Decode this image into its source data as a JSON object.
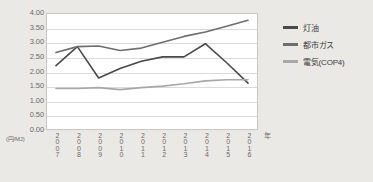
{
  "chart_data": {
    "type": "line",
    "title": "",
    "xlabel": "年",
    "ylabel": "(円/MJ)",
    "ylim": [
      0.0,
      4.0
    ],
    "y_ticks": [
      "4.00",
      "3.50",
      "3.00",
      "2.50",
      "2.00",
      "1.50",
      "1.00",
      "0.50",
      "0.00"
    ],
    "y_tick_values": [
      4.0,
      3.5,
      3.0,
      2.5,
      2.0,
      1.5,
      1.0,
      0.5,
      0.0
    ],
    "grid": true,
    "legend_position": "right",
    "categories": [
      "2007",
      "2008",
      "2009",
      "2010",
      "2011",
      "2012",
      "2013",
      "2014",
      "2015",
      "2016"
    ],
    "series": [
      {
        "name": "灯油",
        "color": "#4a4a4a",
        "values": [
          2.2,
          2.85,
          1.78,
          2.1,
          2.35,
          2.5,
          2.5,
          2.95,
          2.3,
          1.6
        ]
      },
      {
        "name": "都市ガス",
        "color": "#6e6e6e",
        "values": [
          2.65,
          2.85,
          2.87,
          2.72,
          2.8,
          3.0,
          3.2,
          3.35,
          3.55,
          3.75
        ]
      },
      {
        "name": "電気(COP4)",
        "color": "#a8a8a8",
        "values": [
          1.42,
          1.42,
          1.45,
          1.38,
          1.45,
          1.5,
          1.58,
          1.68,
          1.72,
          1.72
        ]
      }
    ]
  },
  "legend": {
    "items": [
      {
        "label": "灯油"
      },
      {
        "label": "都市ガス"
      },
      {
        "label": "電気(COP4)"
      }
    ]
  },
  "axes": {
    "y_unit": "(円/MJ)",
    "x_unit": "年"
  },
  "colors": {
    "background": "#ebe9e6",
    "plot_background": "#ffffff",
    "gridline": "#dedbd7",
    "frame": "#c9c7c4",
    "text": "#6b6a68"
  }
}
